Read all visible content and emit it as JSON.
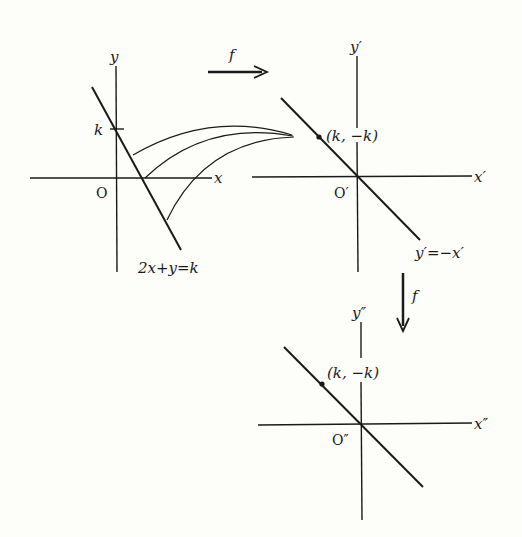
{
  "figure": {
    "type": "coordinate-mapping-diagram",
    "map_symbol": "f",
    "panels": [
      {
        "id": "original",
        "x_axis_label": "x",
        "y_axis_label": "y",
        "origin_label": "O",
        "tick_label": "k",
        "line_label": "2x+y=k",
        "arcs_count": 3
      },
      {
        "id": "image",
        "x_axis_label": "x′",
        "y_axis_label": "y′",
        "origin_label": "O′",
        "point_label": "(k, −k)",
        "line_label": "y′=−x′"
      },
      {
        "id": "image-of-image",
        "x_axis_label": "x″",
        "y_axis_label": "y″",
        "origin_label": "O″",
        "point_label": "(k, −k)"
      }
    ],
    "arrows": [
      {
        "direction": "right",
        "label": "f"
      },
      {
        "direction": "down",
        "label": "f"
      }
    ]
  }
}
